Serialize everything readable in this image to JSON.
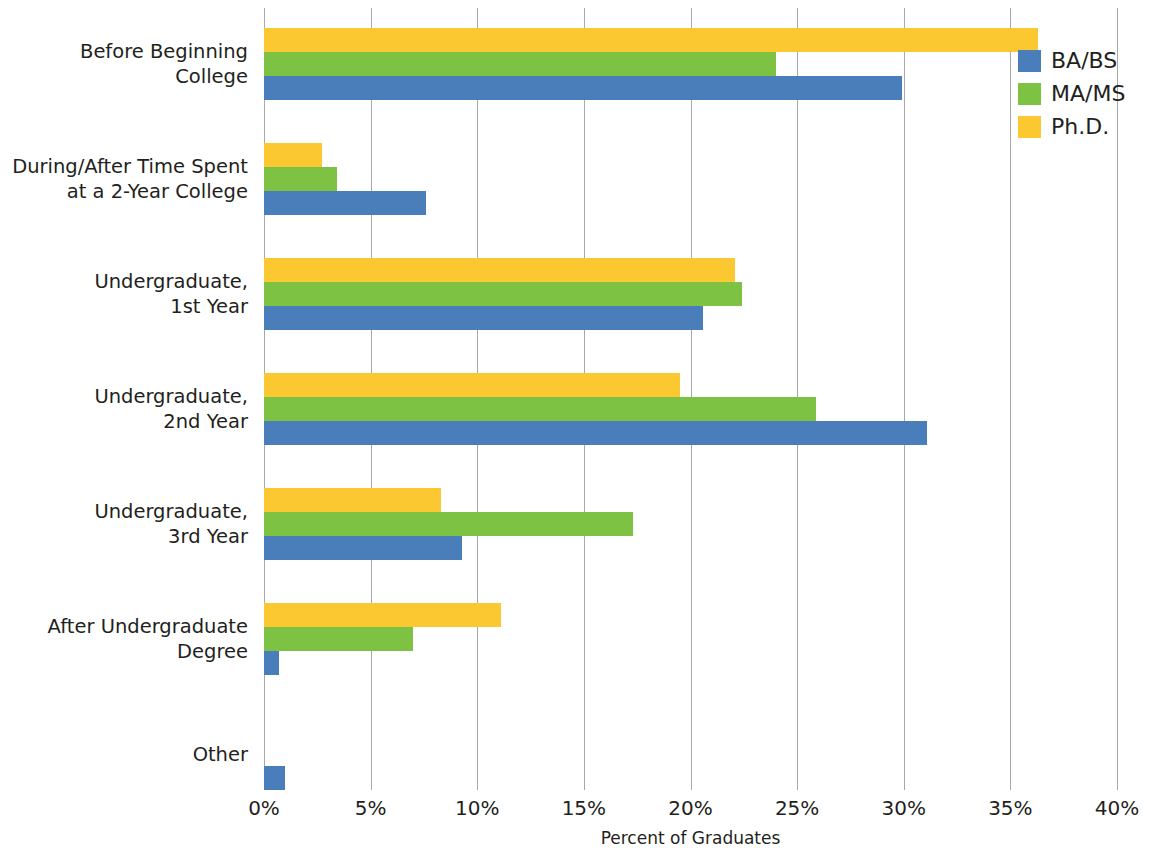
{
  "chart_data": {
    "type": "bar",
    "orientation": "horizontal",
    "title": "",
    "xlabel": "Percent of Graduates",
    "ylabel": "",
    "xlim": [
      0,
      40
    ],
    "xticks": [
      "0%",
      "5%",
      "10%",
      "15%",
      "20%",
      "25%",
      "30%",
      "35%",
      "40%"
    ],
    "xtick_values": [
      0,
      5,
      10,
      15,
      20,
      25,
      30,
      35,
      40
    ],
    "grid": "vertical",
    "legend_position": "top-right",
    "categories": [
      "Before Beginning\nCollege",
      "During/After Time Spent\nat a 2-Year College",
      "Undergraduate,\n1st Year",
      "Undergraduate,\n2nd Year",
      "Undergraduate,\n3rd Year",
      "After Undergraduate\nDegree",
      "Other"
    ],
    "series": [
      {
        "name": "BA/BS",
        "color": "#4a7ebb",
        "values": [
          29.9,
          7.6,
          20.6,
          31.1,
          9.3,
          0.7,
          1.0
        ]
      },
      {
        "name": "MA/MS",
        "color": "#7dc242",
        "values": [
          24.0,
          3.4,
          22.4,
          25.9,
          17.3,
          7.0,
          0.0
        ]
      },
      {
        "name": "Ph.D.",
        "color": "#fbc832",
        "values": [
          36.3,
          2.7,
          22.1,
          19.5,
          8.3,
          11.1,
          0.0
        ]
      }
    ]
  },
  "legend": {
    "items": [
      {
        "label": "BA/BS"
      },
      {
        "label": "MA/MS"
      },
      {
        "label": "Ph.D."
      }
    ]
  },
  "axis": {
    "x_title": "Percent of Graduates"
  }
}
